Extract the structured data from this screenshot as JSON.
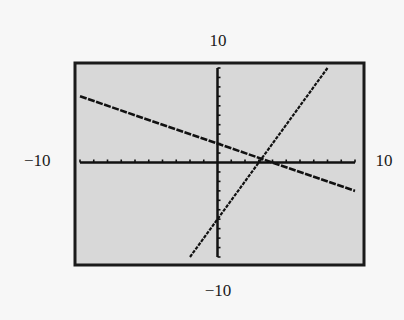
{
  "window": {
    "xmin_label": "−10",
    "xmax_label": "10",
    "ymin_label": "−10",
    "ymax_label": "10"
  },
  "colors": {
    "screen_bg": "#d8d8d8",
    "frame": "#1a1a1a",
    "ink": "#111111",
    "page_bg": "#f7f7f7"
  },
  "chart_data": {
    "type": "line",
    "title": "",
    "xlabel": "",
    "ylabel": "",
    "xlim": [
      -10,
      10
    ],
    "ylim": [
      -10,
      10
    ],
    "xscale": 1,
    "yscale": 1,
    "grid": false,
    "axes_visible": true,
    "tick_labels": {
      "x_min": "−10",
      "x_max": "10",
      "y_min": "−10",
      "y_max": "10"
    },
    "series": [
      {
        "name": "line-1 (decreasing)",
        "equation": "y = -0.5x + 2",
        "slope": -0.5,
        "intercept": 2,
        "x": [
          -10,
          10
        ],
        "y": [
          7,
          -3
        ]
      },
      {
        "name": "line-2 (increasing)",
        "equation": "y = 2x - 6",
        "slope": 2,
        "intercept": -6,
        "x": [
          -2,
          8
        ],
        "y": [
          -10,
          10
        ]
      }
    ],
    "intersection": {
      "x": 3.2,
      "y": 0.4
    },
    "legend": null
  }
}
